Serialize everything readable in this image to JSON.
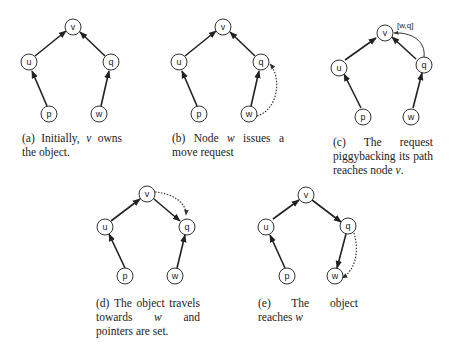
{
  "figure": {
    "node_labels": {
      "v": "v",
      "u": "u",
      "q": "q",
      "p": "p",
      "w": "w"
    },
    "panels": [
      {
        "id": "a",
        "caption_prefix": "(a) Initially,",
        "caption_var": "v",
        "caption_suffix": "owns the object.",
        "edges": [
          [
            "u",
            "v"
          ],
          [
            "q",
            "v"
          ],
          [
            "p",
            "u"
          ],
          [
            "w",
            "q"
          ]
        ],
        "dotted": []
      },
      {
        "id": "b",
        "caption_prefix": "(b) Node",
        "caption_var": "w",
        "caption_suffix": "issues a move request",
        "edges": [
          [
            "u",
            "v"
          ],
          [
            "q",
            "v"
          ],
          [
            "p",
            "u"
          ],
          [
            "w",
            "q"
          ]
        ],
        "dotted": [
          [
            "w",
            "q"
          ]
        ]
      },
      {
        "id": "c",
        "caption_prefix": "(c) The request piggybacking its path reaches node",
        "caption_var": "v",
        "caption_suffix": ".",
        "edges": [
          [
            "u",
            "v"
          ],
          [
            "q",
            "v"
          ],
          [
            "p",
            "u"
          ],
          [
            "w",
            "q"
          ]
        ],
        "dotted": [
          [
            "q",
            "v"
          ]
        ],
        "edge_label": "[w,q]"
      },
      {
        "id": "d",
        "caption_prefix": "(d) The object travels towards",
        "caption_var": "w",
        "caption_suffix": "and pointers are set.",
        "edges": [
          [
            "u",
            "v"
          ],
          [
            "v",
            "q"
          ],
          [
            "p",
            "u"
          ],
          [
            "w",
            "q"
          ]
        ],
        "dotted": [
          [
            "v",
            "q"
          ]
        ]
      },
      {
        "id": "e",
        "caption_prefix": "(e) The object reaches",
        "caption_var": "w",
        "caption_suffix": "",
        "edges": [
          [
            "u",
            "v"
          ],
          [
            "v",
            "q"
          ],
          [
            "p",
            "u"
          ],
          [
            "q",
            "w"
          ]
        ],
        "dotted": [
          [
            "q",
            "w"
          ]
        ]
      }
    ]
  }
}
